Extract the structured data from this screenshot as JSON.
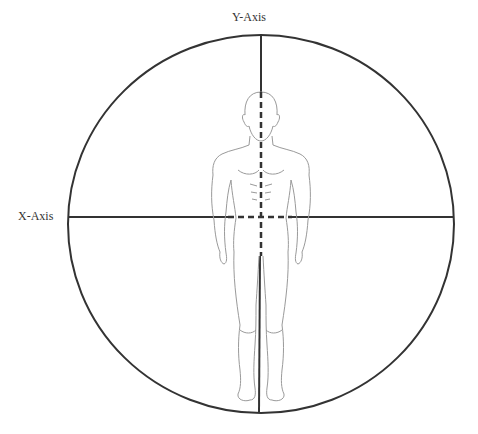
{
  "diagram": {
    "y_axis_label": "Y-Axis",
    "x_axis_label": "X-Axis",
    "colors": {
      "line": "#333333",
      "figure_outline": "#9a9a9a",
      "background": "#ffffff"
    }
  }
}
